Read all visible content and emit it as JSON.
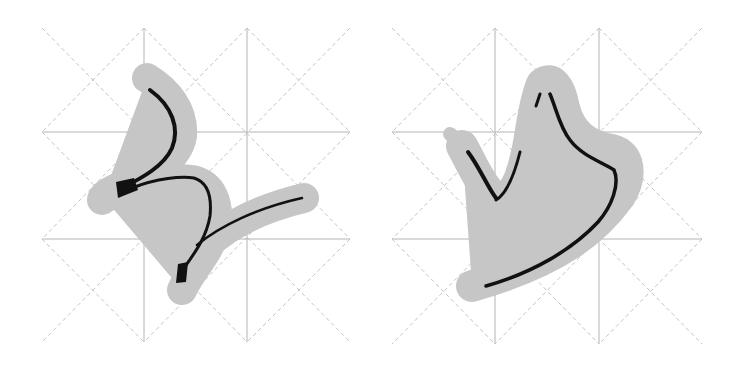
{
  "colors": {
    "background": "#ffffff",
    "grid_solid": "#b4b4b4",
    "grid_dashed": "#c4c4c4",
    "halo": "#c6c6c6",
    "ink": "#111111"
  },
  "panels": [
    {
      "id": "left",
      "description": "Calligraphy practice grid (mi-zi-ge) with cursive brush stroke form resembling 'ㄋ'-like zigzag with halo outline",
      "grid": "3x3 solid with diagonal dashed lattice"
    },
    {
      "id": "right",
      "description": "Calligraphy practice grid (mi-zi-ge) with cursive brush stroke form resembling '少' fragment / '火'-like radical with halo outline",
      "grid": "3x3 solid with diagonal dashed lattice"
    }
  ]
}
